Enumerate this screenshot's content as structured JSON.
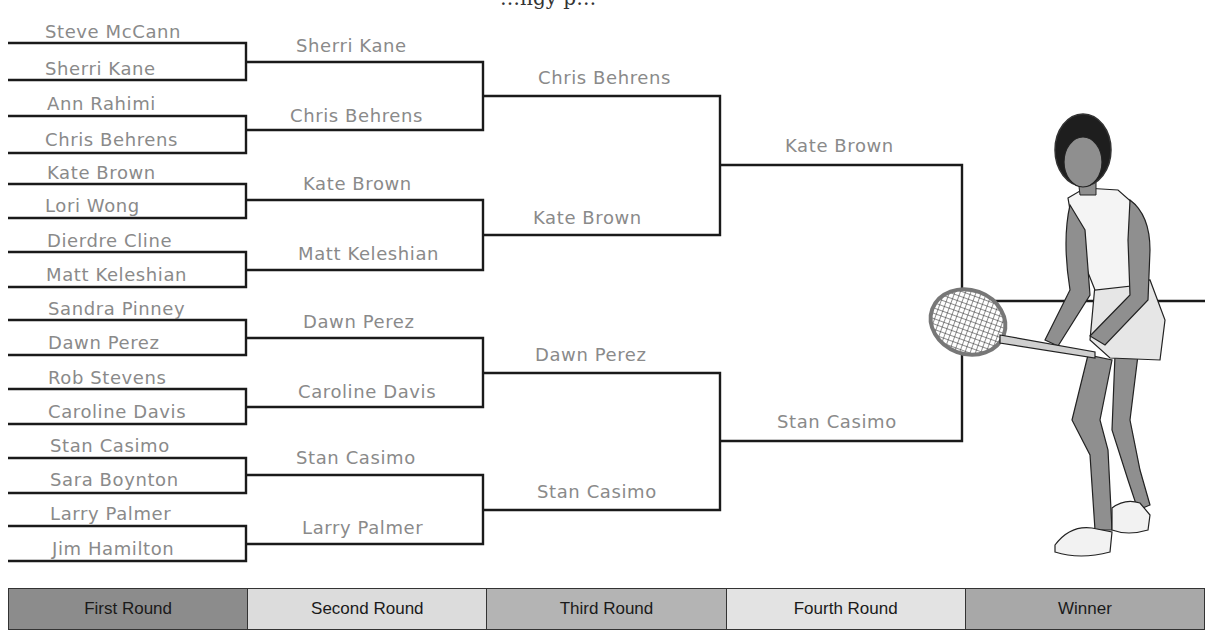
{
  "header": {
    "clipped_title_fragment": "…ngy p…"
  },
  "colors": {
    "line": "#1a1a1a",
    "name_text": "#8a8a8a",
    "first_round": "#8c8c8c",
    "second_round": "#dcdcdc",
    "third_round": "#b4b4b4",
    "fourth_round": "#e3e3e3",
    "winner": "#a8a8a8"
  },
  "bracket": {
    "first_round": [
      "Steve McCann",
      "Sherri Kane",
      "Ann Rahimi",
      "Chris Behrens",
      "Kate Brown",
      "Lori Wong",
      "Dierdre Cline",
      "Matt Keleshian",
      "Sandra Pinney",
      "Dawn Perez",
      "Rob Stevens",
      "Caroline Davis",
      "Stan Casimo",
      "Sara Boynton",
      "Larry Palmer",
      "Jim Hamilton"
    ],
    "second_round": [
      "Sherri Kane",
      "Chris Behrens",
      "Kate Brown",
      "Matt Keleshian",
      "Dawn Perez",
      "Caroline Davis",
      "Stan Casimo",
      "Larry Palmer"
    ],
    "third_round": [
      "Chris Behrens",
      "Kate Brown",
      "Dawn Perez",
      "Stan Casimo"
    ],
    "fourth_round": [
      "Kate Brown",
      "Stan Casimo"
    ],
    "winner": ""
  },
  "illustration": {
    "subject": "tennis-player-illustration"
  },
  "legend": [
    {
      "label": "First Round",
      "color": "#8c8c8c"
    },
    {
      "label": "Second Round",
      "color": "#dcdcdc"
    },
    {
      "label": "Third Round",
      "color": "#b4b4b4"
    },
    {
      "label": "Fourth Round",
      "color": "#e3e3e3"
    },
    {
      "label": "Winner",
      "color": "#a8a8a8"
    }
  ]
}
